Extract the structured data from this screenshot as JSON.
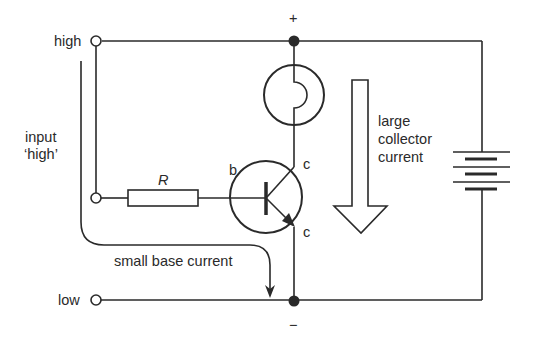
{
  "diagram": {
    "type": "transistor switching circuit",
    "colors": {
      "line": "#2a2a2a",
      "background": "#ffffff"
    },
    "terminals": {
      "high_label": "high",
      "low_label": "low"
    },
    "supply": {
      "positive_label": "+",
      "negative_label": "−"
    },
    "input_label_line1": "input",
    "input_label_line2": "‘high’",
    "resistor_label": "R",
    "transistor": {
      "base_label": "b",
      "collector_label": "c",
      "emitter_label": "c"
    },
    "collector_current_line1": "large",
    "collector_current_line2": "collector",
    "collector_current_line3": "current",
    "base_current_label": "small base current",
    "components": [
      "input terminal high",
      "input terminal low",
      "resistor R",
      "NPN transistor",
      "lamp",
      "battery",
      "current arrows"
    ]
  }
}
